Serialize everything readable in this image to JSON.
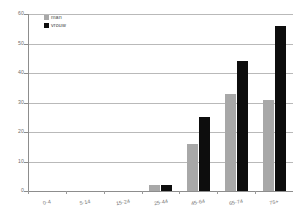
{
  "chart_data": {
    "type": "bar",
    "title": "",
    "subtitle": "",
    "xlabel": "",
    "ylabel": "",
    "categories": [
      "0-4",
      "5-14",
      "15-24",
      "25-44",
      "45-64",
      "65-74",
      "75+"
    ],
    "series": [
      {
        "name": "man",
        "color": "#a8a8a8",
        "values": [
          0,
          0,
          0,
          2,
          16,
          33,
          31
        ]
      },
      {
        "name": "vrouw",
        "color": "#0d0d0d",
        "values": [
          0,
          0,
          0,
          2,
          25,
          44,
          56
        ]
      }
    ],
    "ylim": [
      0,
      60
    ],
    "yticks": [
      0,
      10,
      20,
      30,
      40,
      50,
      60
    ],
    "ytick_labels": [
      "0",
      "10",
      "20",
      "30",
      "40",
      "50",
      "60"
    ],
    "grid": true,
    "grid_axis": "y",
    "legend_position": "top-left",
    "background": "#ffffff",
    "axis_color": "#8d8d8d",
    "grid_color": "#b9b9b9",
    "tick_label_color": "#6e6e6e"
  },
  "legend": {
    "entries": [
      {
        "label": "man",
        "swatch": "legend-swatch-man"
      },
      {
        "label": "vrouw",
        "swatch": "legend-swatch-vrouw"
      }
    ]
  }
}
